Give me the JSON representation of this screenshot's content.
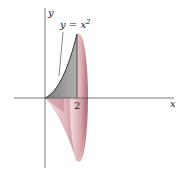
{
  "figure": {
    "type": "solid-of-revolution",
    "curve_label": "y = x²",
    "curve_label_parts": {
      "base": "y = x",
      "exponent": "2"
    },
    "x_axis_label": "x",
    "y_axis_label": "y",
    "tick_label": "2",
    "region": "area under y = x^2 from x = 0 to x = 2, revolved about the x-axis",
    "colors": {
      "axis": "#555555",
      "curve": "#333333",
      "solid_fill": "#c98a92",
      "solid_dark": "#8a4a52",
      "region_fill": "#8f8f8f"
    }
  }
}
